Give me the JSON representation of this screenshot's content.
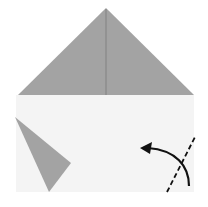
{
  "diagram": {
    "type": "origami-step",
    "colors": {
      "background": "#ffffff",
      "paper_front": "#f4f4f4",
      "paper_back": "#a3a3a3",
      "crease": "#7a7a7a",
      "arrow": "#111111",
      "valley_fold_line": "#111111"
    },
    "top_triangle": {
      "apex": [
        106,
        8
      ],
      "base_left": [
        18,
        95
      ],
      "base_right": [
        194,
        95
      ]
    },
    "paper_rect": {
      "x": 16,
      "y": 95,
      "width": 178,
      "height": 97
    },
    "left_flap": {
      "points": [
        [
          15,
          117
        ],
        [
          71,
          163
        ],
        [
          49,
          192
        ]
      ]
    },
    "fold_line": {
      "style": "dashed",
      "from": [
        167,
        192
      ],
      "to": [
        195,
        137
      ]
    },
    "arrow": {
      "direction": "left-up",
      "from": [
        189,
        186
      ],
      "to": [
        142,
        148
      ]
    }
  }
}
